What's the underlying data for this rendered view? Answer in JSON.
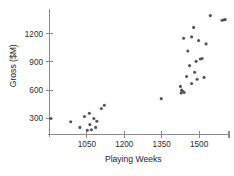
{
  "chart_data": {
    "type": "scatter",
    "title": "",
    "xlabel": "Playing Weeks",
    "ylabel": "Gross ($M)",
    "xlim": [
      900,
      1620
    ],
    "ylim": [
      130,
      1460
    ],
    "grid": false,
    "legend": null,
    "xticks": [
      1050,
      1200,
      1350,
      1500
    ],
    "xtick_labels": [
      "1050",
      "1200",
      "1350",
      "1500"
    ],
    "yticks": [
      300,
      600,
      900,
      1200
    ],
    "ytick_labels": [
      "300",
      "600",
      "900",
      "1200"
    ],
    "marker": {
      "shape": "circle",
      "color": "#555555",
      "size_px": 3.1
    },
    "n_points": 38,
    "points": [
      {
        "x": 905,
        "y": 300
      },
      {
        "x": 985,
        "y": 265
      },
      {
        "x": 1022,
        "y": 205
      },
      {
        "x": 1040,
        "y": 320
      },
      {
        "x": 1052,
        "y": 175
      },
      {
        "x": 1060,
        "y": 355
      },
      {
        "x": 1062,
        "y": 235
      },
      {
        "x": 1068,
        "y": 180
      },
      {
        "x": 1078,
        "y": 300
      },
      {
        "x": 1085,
        "y": 205
      },
      {
        "x": 1090,
        "y": 270
      },
      {
        "x": 1108,
        "y": 405
      },
      {
        "x": 1120,
        "y": 440
      },
      {
        "x": 1348,
        "y": 510
      },
      {
        "x": 1425,
        "y": 640
      },
      {
        "x": 1428,
        "y": 570
      },
      {
        "x": 1430,
        "y": 600
      },
      {
        "x": 1434,
        "y": 588
      },
      {
        "x": 1438,
        "y": 1150
      },
      {
        "x": 1440,
        "y": 575
      },
      {
        "x": 1450,
        "y": 745
      },
      {
        "x": 1455,
        "y": 1015
      },
      {
        "x": 1462,
        "y": 860
      },
      {
        "x": 1470,
        "y": 670
      },
      {
        "x": 1478,
        "y": 1265
      },
      {
        "x": 1482,
        "y": 790
      },
      {
        "x": 1488,
        "y": 905
      },
      {
        "x": 1492,
        "y": 715
      },
      {
        "x": 1498,
        "y": 1125
      },
      {
        "x": 1505,
        "y": 930
      },
      {
        "x": 1512,
        "y": 935
      },
      {
        "x": 1520,
        "y": 735
      },
      {
        "x": 1528,
        "y": 1090
      },
      {
        "x": 1545,
        "y": 1390
      },
      {
        "x": 1592,
        "y": 1340
      },
      {
        "x": 1600,
        "y": 1345
      },
      {
        "x": 1605,
        "y": 1348
      },
      {
        "x": 1470,
        "y": 1165
      }
    ]
  }
}
